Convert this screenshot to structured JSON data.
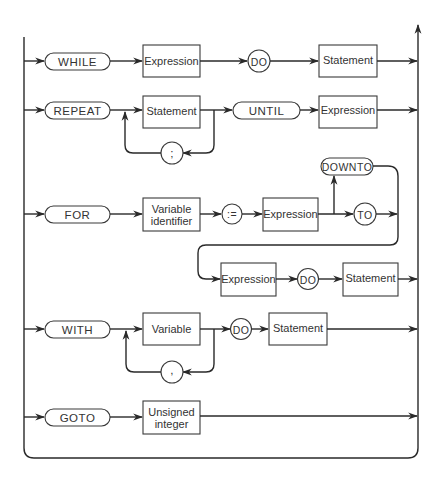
{
  "diagram": {
    "type": "syntax-diagram",
    "colors": {
      "line": "#2a2a2a",
      "background": "#ffffff",
      "text": "#333333"
    },
    "rows": {
      "while": {
        "keyword": "WHILE",
        "expression": "Expression",
        "do": "DO",
        "statement": "Statement"
      },
      "repeat": {
        "keyword": "REPEAT",
        "statement": "Statement",
        "separator": ";",
        "until": "UNTIL",
        "expression": "Expression"
      },
      "for": {
        "keyword": "FOR",
        "variable_line1": "Variable",
        "variable_line2": "identifier",
        "assign": ":=",
        "expression1": "Expression",
        "downto": "DOWNTO",
        "to": "TO",
        "expression2": "Expression",
        "do": "DO",
        "statement": "Statement"
      },
      "with": {
        "keyword": "WITH",
        "variable": "Variable",
        "separator": ",",
        "do": "DO",
        "statement": "Statement"
      },
      "goto": {
        "keyword": "GOTO",
        "label_line1": "Unsigned",
        "label_line2": "integer"
      }
    }
  }
}
